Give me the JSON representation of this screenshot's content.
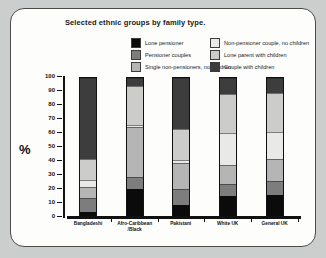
{
  "title": "Selected ethnic groups by family type.",
  "ylabel": "%",
  "legend": {
    "columns": [
      [
        0,
        1,
        2
      ],
      [
        3,
        4,
        5
      ]
    ]
  },
  "chart_data": {
    "type": "bar",
    "stacked": true,
    "title": "Selected ethnic groups by family type.",
    "xlabel": "",
    "ylabel": "%",
    "ylim": [
      0,
      100
    ],
    "yticks": [
      0,
      10,
      20,
      30,
      40,
      50,
      60,
      70,
      80,
      90,
      100
    ],
    "grid": false,
    "legend_position": "top",
    "categories": [
      "Bangladeshi",
      "Afro-Caribbean /Black",
      "Pakistani",
      "White UK",
      "General UK"
    ],
    "series": [
      {
        "name": "Lone pensioner",
        "color": "#0b0b0b",
        "values": [
          3,
          19,
          8,
          14,
          15
        ]
      },
      {
        "name": "Pensioner couples",
        "color": "#7d7d7d",
        "values": [
          10,
          9,
          11,
          9,
          10
        ]
      },
      {
        "name": "Single non-pensioners, no children",
        "color": "#b5b5b5",
        "values": [
          8,
          36,
          19,
          14,
          16
        ]
      },
      {
        "name": "Non-pensioner couple, no children",
        "color": "#e9e9e8",
        "values": [
          5,
          2,
          2,
          23,
          20
        ]
      },
      {
        "name": "Lone parent with children",
        "color": "#cccccb",
        "values": [
          15,
          28,
          23,
          28,
          28
        ]
      },
      {
        "name": "Couple with children",
        "color": "#3d3d3d",
        "values": [
          59,
          6,
          37,
          12,
          11
        ]
      }
    ]
  }
}
